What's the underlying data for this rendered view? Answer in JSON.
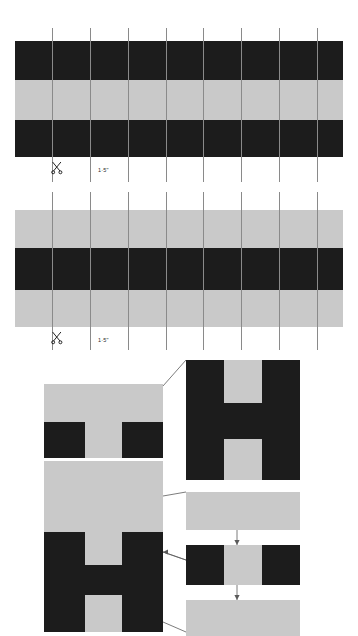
{
  "document": {
    "title": "Paper Weaving Strip Cutting And Assembly Diagram",
    "background_color": "#ffffff"
  },
  "palette": {
    "dark": "#1c1c1c",
    "light": "#c9c9c9",
    "white": "#ffffff",
    "guide_line": "#8a8a8a",
    "connector_line": "#5a5a5a",
    "caption_text": "#2b2b2b"
  },
  "strips": [
    {
      "id": "strip-top",
      "order": "dark-light-dark",
      "x": 15,
      "y": 41,
      "width": 328,
      "height": 116,
      "bands": [
        {
          "tone": "dark",
          "y": 0,
          "height": 39
        },
        {
          "tone": "light",
          "y": 39,
          "height": 40
        },
        {
          "tone": "dark",
          "y": 79,
          "height": 37
        }
      ],
      "guide_lines": {
        "count": 8,
        "x_positions": [
          52,
          90,
          128,
          166,
          203,
          241,
          279,
          317
        ],
        "top": 28,
        "bottom": 182
      },
      "scissors": {
        "x": 50,
        "y": 161,
        "label": "scissors-icon"
      },
      "measure_label": {
        "text": "1·5\"",
        "x": 98,
        "y": 168
      }
    },
    {
      "id": "strip-bottom",
      "order": "light-dark-light",
      "x": 15,
      "y": 210,
      "width": 328,
      "height": 117,
      "bands": [
        {
          "tone": "light",
          "y": 0,
          "height": 38
        },
        {
          "tone": "dark",
          "y": 38,
          "height": 42
        },
        {
          "tone": "light",
          "y": 80,
          "height": 37
        }
      ],
      "guide_lines": {
        "count": 8,
        "x_positions": [
          52,
          90,
          128,
          166,
          203,
          241,
          279,
          317
        ],
        "top": 192,
        "bottom": 350
      },
      "scissors": {
        "x": 50,
        "y": 331,
        "label": "scissors-icon"
      },
      "measure_label": {
        "text": "1·5\"",
        "x": 98,
        "y": 338
      }
    }
  ],
  "assembly": {
    "left_panel": {
      "id": "woven-result-panel",
      "x": 44,
      "y": 384,
      "width": 119,
      "height": 248,
      "rows": [
        {
          "tone": "light",
          "y": 0,
          "height": 38
        },
        {
          "tone": "dark",
          "y": 38,
          "height": 38,
          "pattern": "dark-light-dark"
        },
        {
          "tone": "light",
          "y": 76,
          "height": 36
        },
        {
          "tone": "light",
          "y": 112,
          "height": 36
        },
        {
          "tone": "dark",
          "y": 148,
          "height": 50,
          "pattern": "dark-light-dark"
        },
        {
          "tone": "dark",
          "y": 198,
          "height": 50,
          "pattern": "dark-light-dark"
        }
      ]
    },
    "detail_panel": {
      "id": "letterform-detail-panel",
      "x": 186,
      "y": 360,
      "width": 114,
      "height": 120,
      "letterform": "H"
    },
    "step_panels": [
      {
        "id": "step-panel-1",
        "x": 186,
        "y": 492,
        "width": 114,
        "height": 38,
        "pattern": "solid-light"
      },
      {
        "id": "step-panel-2",
        "x": 186,
        "y": 545,
        "width": 114,
        "height": 40,
        "pattern": "dark-light-dark"
      },
      {
        "id": "step-panel-3",
        "x": 186,
        "y": 600,
        "width": 114,
        "height": 36,
        "pattern": "solid-light"
      }
    ],
    "arrows": [
      {
        "id": "arrow-step-1-to-2",
        "x": 237,
        "y1": 530,
        "y2": 545,
        "direction": "down"
      },
      {
        "id": "arrow-step-2-to-3",
        "x": 237,
        "y1": 585,
        "y2": 600,
        "direction": "down"
      }
    ],
    "leaders": [
      {
        "id": "leader-to-detail-panel",
        "from_x": 163,
        "from_y": 386,
        "to_x": 186,
        "to_y": 360
      },
      {
        "id": "leader-to-step-panel-1",
        "from_x": 163,
        "from_y": 496,
        "to_x": 186,
        "to_y": 492
      },
      {
        "id": "leader-to-step-panel-2",
        "from_x": 163,
        "from_y": 552,
        "to_x": 186,
        "to_y": 560,
        "arrow_at": "from"
      },
      {
        "id": "leader-to-step-panel-3",
        "from_x": 163,
        "from_y": 622,
        "to_x": 186,
        "to_y": 632
      }
    ]
  }
}
